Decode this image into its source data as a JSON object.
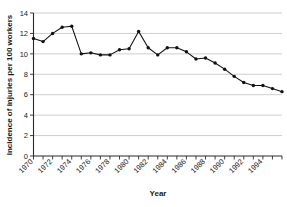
{
  "chart_data": {
    "type": "line",
    "title": "",
    "xlabel": "Year",
    "ylabel": "Incidence of injuries per 100 workers",
    "xlim": [
      1970,
      1996
    ],
    "ylim": [
      0,
      14
    ],
    "ytick_values": [
      0,
      2,
      4,
      6,
      8,
      10,
      12,
      14
    ],
    "ytick_labels": [
      "0",
      "2",
      "4",
      "6",
      "8",
      "10",
      "12",
      "14"
    ],
    "xtick_values": [
      1970,
      1972,
      1974,
      1976,
      1978,
      1980,
      1982,
      1984,
      1986,
      1988,
      1990,
      1992,
      1994
    ],
    "xtick_labels": [
      "1970",
      "1972",
      "1974",
      "1976",
      "1978",
      "1980",
      "1982",
      "1984",
      "1986",
      "1988",
      "1990",
      "1992",
      "1994"
    ],
    "grid": "horizontal",
    "legend": "none",
    "marker": "filled-circle",
    "x": [
      1970,
      1971,
      1972,
      1973,
      1974,
      1975,
      1976,
      1977,
      1978,
      1979,
      1980,
      1981,
      1982,
      1983,
      1984,
      1985,
      1986,
      1987,
      1988,
      1989,
      1990,
      1991,
      1992,
      1993,
      1994,
      1995,
      1996
    ],
    "values": [
      11.5,
      11.2,
      12.0,
      12.6,
      12.7,
      10.0,
      10.1,
      9.9,
      9.9,
      10.4,
      10.5,
      12.2,
      10.6,
      9.9,
      10.6,
      10.6,
      10.2,
      9.5,
      9.6,
      9.1,
      8.5,
      7.8,
      7.2,
      6.9,
      6.9,
      6.6,
      6.3
    ],
    "series": [
      {
        "name": "Incidence of injuries per 100 workers",
        "values": [
          11.5,
          11.2,
          12.0,
          12.6,
          12.7,
          10.0,
          10.1,
          9.9,
          9.9,
          10.4,
          10.5,
          12.2,
          10.6,
          9.9,
          10.6,
          10.6,
          10.2,
          9.5,
          9.6,
          9.1,
          8.5,
          7.8,
          7.2,
          6.9,
          6.9,
          6.6,
          6.3
        ],
        "color": "#111111"
      }
    ],
    "colors": {
      "line": "#111111",
      "marker": "#111111",
      "grid": "#b9b9b9",
      "axis": "#2b2b2b",
      "background": "#ffffff",
      "text": "#1a1a1a"
    }
  }
}
